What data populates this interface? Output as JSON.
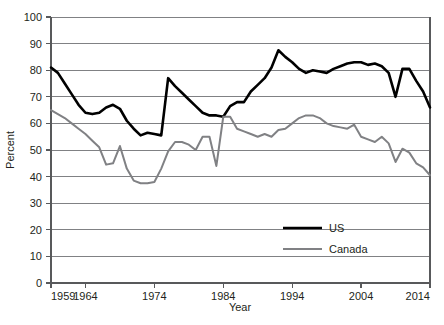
{
  "chart_data": {
    "type": "line",
    "title": "",
    "xlabel": "Year",
    "ylabel": "Percent",
    "xlim": [
      1959,
      2014
    ],
    "ylim": [
      0,
      100
    ],
    "grid": true,
    "legend_position": "inside-bottom-center",
    "x_ticks": [
      1959,
      1964,
      1974,
      1984,
      1994,
      2004,
      2014
    ],
    "x_tick_labels": [
      "1959",
      "1964",
      "1974",
      "1984",
      "1994",
      "2004",
      "2014"
    ],
    "y_ticks": [
      0,
      10,
      20,
      30,
      40,
      50,
      60,
      70,
      80,
      90,
      100
    ],
    "y_tick_labels": [
      "0",
      "10",
      "20",
      "30",
      "40",
      "50",
      "60",
      "70",
      "80",
      "90",
      "100"
    ],
    "x": [
      1959,
      1960,
      1961,
      1962,
      1963,
      1964,
      1965,
      1966,
      1967,
      1968,
      1969,
      1970,
      1971,
      1972,
      1973,
      1974,
      1975,
      1976,
      1977,
      1978,
      1979,
      1980,
      1981,
      1982,
      1983,
      1984,
      1985,
      1986,
      1987,
      1988,
      1989,
      1990,
      1991,
      1992,
      1993,
      1994,
      1995,
      1996,
      1997,
      1998,
      1999,
      2000,
      2001,
      2002,
      2003,
      2004,
      2005,
      2006,
      2007,
      2008,
      2009,
      2010,
      2011,
      2012,
      2013,
      2014
    ],
    "series": [
      {
        "name": "US",
        "color": "#000000",
        "line_width": 2.6,
        "values": [
          81,
          79,
          75,
          71,
          67,
          64,
          63.5,
          64,
          66,
          67,
          65.5,
          61,
          58,
          55.5,
          56.5,
          56,
          55.5,
          77,
          74,
          71.5,
          69,
          66.5,
          64,
          63,
          63,
          62.5,
          66.5,
          68,
          68,
          72,
          74.5,
          77,
          81,
          87.5,
          85,
          83,
          80.5,
          79,
          80,
          79.5,
          79,
          80.5,
          81.5,
          82.5,
          83,
          83,
          82,
          82.5,
          81.5,
          79,
          70,
          80.5,
          80.5,
          76,
          72,
          66
        ]
      },
      {
        "name": "Canada",
        "color": "#808184",
        "line_width": 2.0,
        "values": [
          65,
          63.5,
          62,
          60,
          58,
          56,
          53.5,
          51,
          44.5,
          45,
          51.5,
          43,
          38.5,
          37.5,
          37.5,
          38,
          43,
          49.5,
          53,
          53,
          52,
          50,
          55,
          55,
          44,
          62.5,
          62.5,
          58,
          57,
          56,
          55,
          56,
          55,
          57.5,
          58,
          60,
          62,
          63,
          63,
          62,
          60,
          59,
          58.5,
          58,
          59.5,
          55,
          54,
          53,
          55,
          52.5,
          45.5,
          50.5,
          49,
          45,
          43.5,
          40.5
        ]
      }
    ]
  },
  "legend": {
    "items": [
      {
        "label": "US",
        "color": "#000000"
      },
      {
        "label": "Canada",
        "color": "#808184"
      }
    ]
  },
  "axes": {
    "x_title": "Year",
    "y_title": "Percent"
  }
}
